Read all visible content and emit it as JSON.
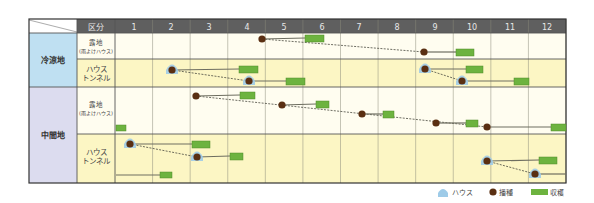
{
  "table": {
    "corner_label": "",
    "category_header": "区分",
    "months": [
      "1",
      "2",
      "3",
      "4",
      "5",
      "6",
      "7",
      "8",
      "9",
      "10",
      "11",
      "12"
    ],
    "colors": {
      "header_bg": "#5f5f5f",
      "header_text": "#e8e8e8",
      "region_cool_bg": "#bfe0f2",
      "region_mid_bg": "#dcdcef",
      "row_open_bg": "#fffdf0",
      "row_house_bg": "#fcf6c4",
      "grid_line": "#8a8a7a",
      "border": "#333333",
      "sow_dot": "#5a2f12",
      "harvest_box": "#6db33f",
      "harvest_box_border": "#4f8a2a",
      "line": "#6e6e60",
      "house_icon": "#9ecbe8"
    },
    "regions": [
      {
        "label": "冷涼地",
        "rows": [
          {
            "category_line1": "露地",
            "category_line2": "(雨よけハウス)",
            "type": "open"
          },
          {
            "category_line1": "ハウス",
            "category_line2": "トンネル",
            "type": "house"
          }
        ]
      },
      {
        "label": "中間地",
        "rows": [
          {
            "category_line1": "露地",
            "category_line2": "(雨よけハウス)",
            "type": "open"
          },
          {
            "category_line1": "ハウス",
            "category_line2": "トンネル",
            "type": "house"
          }
        ]
      }
    ]
  },
  "legend": {
    "house_label": "ハウス",
    "sow_label": "播種",
    "harvest_label": "収穫"
  },
  "chart_data": {
    "type": "gantt",
    "title": "",
    "xlabel": "月",
    "x_ticks": [
      "1",
      "2",
      "3",
      "4",
      "5",
      "6",
      "7",
      "8",
      "9",
      "10",
      "11",
      "12"
    ],
    "legend": [
      "ハウス",
      "播種",
      "収穫"
    ],
    "series": [
      {
        "region": "冷涼地",
        "category": "露地(雨よけハウス)",
        "schedules": [
          {
            "sow_month": 4.9,
            "house": false,
            "harvest_start": 6.0,
            "harvest_end": 6.5
          },
          {
            "sow_month": 9.2,
            "house": false,
            "harvest_start": 10.1,
            "harvest_end": 10.6
          }
        ],
        "dashed_link": [
          [
            4.9,
            9.2
          ]
        ]
      },
      {
        "region": "冷涼地",
        "category": "ハウストンネル",
        "schedules": [
          {
            "sow_month": 2.5,
            "house": true,
            "harvest_start": 4.3,
            "harvest_end": 4.8
          },
          {
            "sow_month": 4.6,
            "house": true,
            "harvest_start": 5.6,
            "harvest_end": 6.1
          },
          {
            "sow_month": 9.2,
            "house": true,
            "harvest_start": 10.4,
            "harvest_end": 10.8
          },
          {
            "sow_month": 10.2,
            "house": true,
            "harvest_start": 11.7,
            "harvest_end": 12.1
          }
        ],
        "dashed_link": [
          [
            2.5,
            4.6
          ],
          [
            9.2,
            10.2
          ]
        ]
      },
      {
        "region": "中間地",
        "category": "露地(雨よけハウス)",
        "schedules": [
          {
            "sow_month": 3.2,
            "house": false,
            "harvest_start": 4.3,
            "harvest_end": 4.7
          },
          {
            "sow_month": 5.4,
            "house": false,
            "harvest_start": 6.3,
            "harvest_end": 6.6
          },
          {
            "sow_month": 7.6,
            "house": false,
            "harvest_start": 8.1,
            "harvest_end": 8.4
          },
          {
            "sow_month": 9.5,
            "house": false,
            "harvest_start": 10.3,
            "harvest_end": 10.6
          },
          {
            "sow_month": 10.9,
            "house": false,
            "harvest_start": 12.6,
            "harvest_end": 13.0
          },
          {
            "sow_month": null,
            "house": false,
            "harvest_start": 1.0,
            "harvest_end": 1.3
          }
        ],
        "dashed_link": [
          [
            3.2,
            10.9
          ]
        ]
      },
      {
        "region": "中間地",
        "category": "ハウストンネル",
        "schedules": [
          {
            "sow_month": 1.4,
            "house": true,
            "harvest_start": 3.0,
            "harvest_end": 3.5
          },
          {
            "sow_month": 3.2,
            "house": true,
            "harvest_start": 4.1,
            "harvest_end": 4.4
          },
          {
            "sow_month": 1.0,
            "house": false,
            "harvest_start": 2.2,
            "harvest_end": 2.5
          },
          {
            "sow_month": 10.9,
            "house": true,
            "harvest_start": 12.3,
            "harvest_end": 12.8
          },
          {
            "sow_month": 12.2,
            "house": true,
            "harvest_start": null,
            "harvest_end": 13.0
          }
        ],
        "dashed_link": [
          [
            1.4,
            3.2
          ],
          [
            10.9,
            12.2
          ]
        ]
      }
    ],
    "marks_px": {
      "sow": [
        {
          "x": 262,
          "y": 39,
          "house": false
        },
        {
          "x": 424,
          "y": 52,
          "house": false
        },
        {
          "x": 172,
          "y": 70,
          "house": true
        },
        {
          "x": 249,
          "y": 81,
          "house": true
        },
        {
          "x": 425,
          "y": 69,
          "house": true
        },
        {
          "x": 462,
          "y": 81,
          "house": true
        },
        {
          "x": 196,
          "y": 96,
          "house": false
        },
        {
          "x": 282,
          "y": 105,
          "house": false
        },
        {
          "x": 362,
          "y": 114,
          "house": false
        },
        {
          "x": 436,
          "y": 123,
          "house": false
        },
        {
          "x": 487,
          "y": 127,
          "house": false
        },
        {
          "x": 130,
          "y": 144,
          "house": true
        },
        {
          "x": 197,
          "y": 157,
          "house": true
        },
        {
          "x": 487,
          "y": 161,
          "house": true
        },
        {
          "x": 535,
          "y": 174,
          "house": true
        }
      ],
      "harvest": [
        {
          "x": 305,
          "y": 35,
          "w": 19,
          "h": 7
        },
        {
          "x": 456,
          "y": 49,
          "w": 18,
          "h": 7
        },
        {
          "x": 239,
          "y": 66,
          "w": 19,
          "h": 7
        },
        {
          "x": 286,
          "y": 78,
          "w": 19,
          "h": 7
        },
        {
          "x": 466,
          "y": 66,
          "w": 17,
          "h": 7
        },
        {
          "x": 514,
          "y": 78,
          "w": 15,
          "h": 7
        },
        {
          "x": 240,
          "y": 92,
          "w": 15,
          "h": 7
        },
        {
          "x": 316,
          "y": 101,
          "w": 13,
          "h": 7
        },
        {
          "x": 383,
          "y": 111,
          "w": 11,
          "h": 7
        },
        {
          "x": 466,
          "y": 120,
          "w": 12,
          "h": 7
        },
        {
          "x": 551,
          "y": 124,
          "w": 15,
          "h": 7
        },
        {
          "x": 116,
          "y": 125,
          "w": 10,
          "h": 6
        },
        {
          "x": 192,
          "y": 141,
          "w": 18,
          "h": 7
        },
        {
          "x": 230,
          "y": 153,
          "w": 13,
          "h": 7
        },
        {
          "x": 160,
          "y": 172,
          "w": 12,
          "h": 6
        },
        {
          "x": 539,
          "y": 157,
          "w": 18,
          "h": 7
        }
      ],
      "solid_lines": [
        [
          262,
          39,
          305,
          38
        ],
        [
          424,
          52,
          456,
          52
        ],
        [
          172,
          70,
          239,
          69
        ],
        [
          249,
          81,
          286,
          81
        ],
        [
          425,
          69,
          466,
          69
        ],
        [
          462,
          81,
          514,
          81
        ],
        [
          196,
          96,
          240,
          95
        ],
        [
          282,
          105,
          316,
          104
        ],
        [
          362,
          114,
          383,
          114
        ],
        [
          436,
          123,
          466,
          123
        ],
        [
          487,
          127,
          551,
          127
        ],
        [
          130,
          144,
          192,
          144
        ],
        [
          197,
          157,
          230,
          156
        ],
        [
          116,
          175,
          160,
          175
        ],
        [
          487,
          161,
          539,
          160
        ],
        [
          535,
          174,
          566,
          174
        ]
      ],
      "dashed_lines": [
        [
          262,
          39,
          424,
          52
        ],
        [
          172,
          70,
          249,
          81
        ],
        [
          425,
          69,
          462,
          81
        ],
        [
          196,
          96,
          487,
          127
        ],
        [
          130,
          144,
          197,
          157
        ],
        [
          487,
          161,
          535,
          174
        ]
      ]
    }
  }
}
